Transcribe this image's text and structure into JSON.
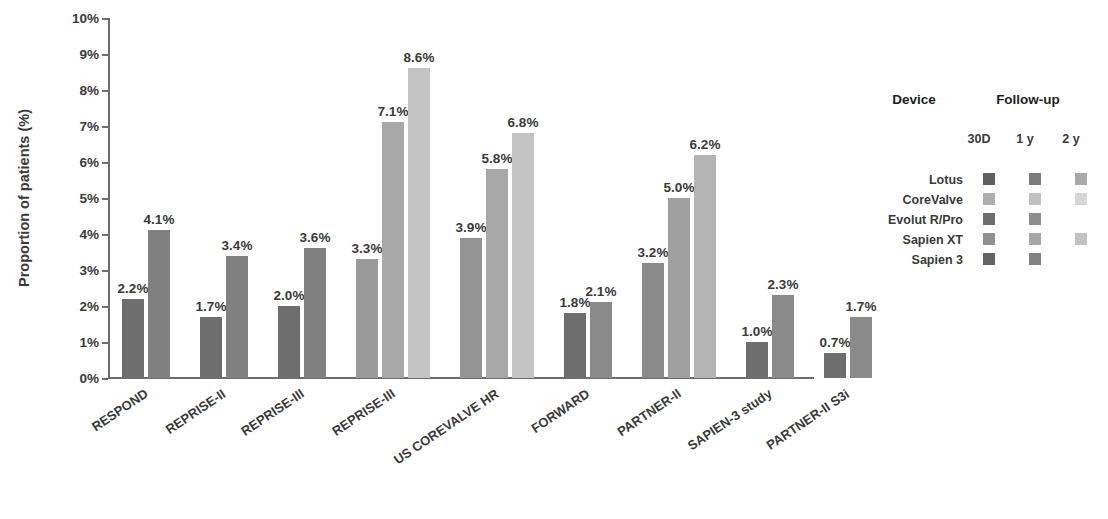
{
  "chart_data": {
    "type": "bar",
    "title": "",
    "xlabel": "",
    "ylabel": "Proportion of patients (%)",
    "ylim": [
      0,
      10
    ],
    "ytick_labels": [
      "0%",
      "1%",
      "2%",
      "3%",
      "4%",
      "5%",
      "6%",
      "7%",
      "8%",
      "9%",
      "10%"
    ],
    "ytick_values": [
      0,
      1,
      2,
      3,
      4,
      5,
      6,
      7,
      8,
      9,
      10
    ],
    "grid": false,
    "value_label_suffix": "%",
    "categories": [
      "RESPOND",
      "REPRISE-II",
      "REPRISE-III",
      "REPRISE-III",
      "US COREVALVE HR",
      "FORWARD",
      "PARTNER-II",
      "SAPIEN-3 study",
      "PARTNER-II S3i"
    ],
    "groups": [
      {
        "category": "RESPOND",
        "bars": [
          {
            "value": 2.2,
            "label": "2.2%",
            "device": "Lotus",
            "followup": "30D",
            "color": "#6e6e6e"
          },
          {
            "value": 4.1,
            "label": "4.1%",
            "device": "Lotus",
            "followup": "1 y",
            "color": "#808080"
          }
        ]
      },
      {
        "category": "REPRISE-II",
        "bars": [
          {
            "value": 1.7,
            "label": "1.7%",
            "device": "Lotus",
            "followup": "30D",
            "color": "#6e6e6e"
          },
          {
            "value": 3.4,
            "label": "3.4%",
            "device": "Lotus",
            "followup": "1 y",
            "color": "#808080"
          }
        ]
      },
      {
        "category": "REPRISE-III",
        "bars": [
          {
            "value": 2.0,
            "label": "2.0%",
            "device": "Lotus",
            "followup": "30D",
            "color": "#6e6e6e"
          },
          {
            "value": 3.6,
            "label": "3.6%",
            "device": "Lotus",
            "followup": "1 y",
            "color": "#808080"
          }
        ]
      },
      {
        "category": "REPRISE-III",
        "bars": [
          {
            "value": 3.3,
            "label": "3.3%",
            "device": "Evolut R/Pro",
            "followup": "30D",
            "color": "#9a9a9a"
          },
          {
            "value": 7.1,
            "label": "7.1%",
            "device": "Evolut R/Pro",
            "followup": "1 y",
            "color": "#a8a8a8"
          },
          {
            "value": 8.6,
            "label": "8.6%",
            "device": "CoreValve",
            "followup": "1 y",
            "color": "#c4c4c4"
          }
        ]
      },
      {
        "category": "US COREVALVE HR",
        "bars": [
          {
            "value": 3.9,
            "label": "3.9%",
            "device": "CoreValve",
            "followup": "30D",
            "color": "#949494"
          },
          {
            "value": 5.8,
            "label": "5.8%",
            "device": "CoreValve",
            "followup": "1 y",
            "color": "#a8a8a8"
          },
          {
            "value": 6.8,
            "label": "6.8%",
            "device": "CoreValve",
            "followup": "2 y",
            "color": "#c4c4c4"
          }
        ]
      },
      {
        "category": "FORWARD",
        "bars": [
          {
            "value": 1.8,
            "label": "1.8%",
            "device": "Evolut R/Pro",
            "followup": "30D",
            "color": "#6e6e6e"
          },
          {
            "value": 2.1,
            "label": "2.1%",
            "device": "Evolut R/Pro",
            "followup": "1 y",
            "color": "#8a8a8a"
          }
        ]
      },
      {
        "category": "PARTNER-II",
        "bars": [
          {
            "value": 3.2,
            "label": "3.2%",
            "device": "Sapien XT",
            "followup": "30D",
            "color": "#8a8a8a"
          },
          {
            "value": 5.0,
            "label": "5.0%",
            "device": "Sapien XT",
            "followup": "1 y",
            "color": "#a0a0a0"
          },
          {
            "value": 6.2,
            "label": "6.2%",
            "device": "Sapien XT",
            "followup": "2 y",
            "color": "#b4b4b4"
          }
        ]
      },
      {
        "category": "SAPIEN-3 study",
        "bars": [
          {
            "value": 1.0,
            "label": "1.0%",
            "device": "Sapien 3",
            "followup": "30D",
            "color": "#6e6e6e"
          },
          {
            "value": 2.3,
            "label": "2.3%",
            "device": "Sapien 3",
            "followup": "1 y",
            "color": "#8a8a8a"
          }
        ]
      },
      {
        "category": "PARTNER-II S3i",
        "bars": [
          {
            "value": 0.7,
            "label": "0.7%",
            "device": "Sapien 3",
            "followup": "30D",
            "color": "#6e6e6e"
          },
          {
            "value": 1.7,
            "label": "1.7%",
            "device": "Sapien 3",
            "followup": "1 y",
            "color": "#8a8a8a"
          }
        ]
      }
    ]
  },
  "legend": {
    "device_header": "Device",
    "followup_header": "Follow-up",
    "columns": [
      "30D",
      "1 y",
      "2 y"
    ],
    "rows": [
      {
        "device": "Lotus",
        "swatches": [
          "#5f5f5f",
          "#7c7c7c",
          "#a9a9a9"
        ]
      },
      {
        "device": "CoreValve",
        "swatches": [
          "#afafaf",
          "#c0c0c0",
          "#d6d6d6"
        ]
      },
      {
        "device": "Evolut R/Pro",
        "swatches": [
          "#6e6e6e",
          "#8e8e8e",
          null
        ]
      },
      {
        "device": "Sapien XT",
        "swatches": [
          "#909090",
          "#a6a6a6",
          "#c2c2c2"
        ]
      },
      {
        "device": "Sapien 3",
        "swatches": [
          "#636363",
          "#818181",
          null
        ]
      }
    ]
  }
}
